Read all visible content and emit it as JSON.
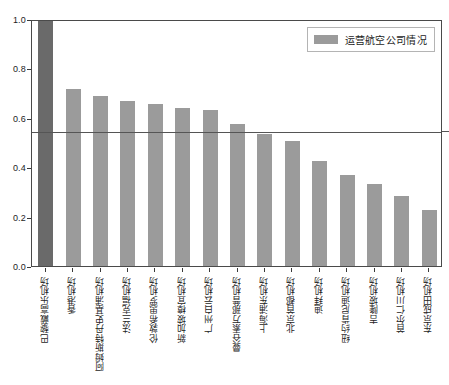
{
  "chart_data": {
    "type": "bar",
    "title": "",
    "xlabel": "",
    "ylabel": "",
    "ylim": [
      0.0,
      1.0
    ],
    "grid": false,
    "legend_position": "top-right",
    "categories": [
      "巴黎戴高乐机场",
      "香港机场",
      "阿姆斯特丹史基浦机场",
      "法兰克福机场",
      "伦敦希思罗机场",
      "新加坡樟宜机场",
      "广州白云机场",
      "曼谷素万那普机场",
      "上海浦东机场",
      "北京首都机场",
      "迪拜机场",
      "纽约肯尼迪机场",
      "吉隆坡机场",
      "首尔仁川机场",
      "东京成田机场"
    ],
    "values": [
      1.0,
      0.715,
      0.688,
      0.668,
      0.655,
      0.638,
      0.63,
      0.575,
      0.533,
      0.505,
      0.425,
      0.368,
      0.333,
      0.285,
      0.225
    ],
    "series": [
      {
        "name": "运营航空公司情况",
        "values": [
          1.0,
          0.715,
          0.688,
          0.668,
          0.655,
          0.638,
          0.63,
          0.575,
          0.533,
          0.505,
          0.425,
          0.368,
          0.333,
          0.285,
          0.225
        ]
      }
    ],
    "ytick_labels": [
      "0.0",
      "0.2",
      "0.4",
      "0.6",
      "0.8",
      "1.0"
    ],
    "ytick_values": [
      0.0,
      0.2,
      0.4,
      0.6,
      0.8,
      1.0
    ],
    "annotations": [
      {
        "type": "hline",
        "value": 0.55,
        "label": ""
      }
    ],
    "colors": {
      "bar": "#9b9b9b",
      "bar_highlight": "#6a6a6a",
      "axis": "#4a4a4a",
      "threshold_line": "#555555",
      "text": "#1d1d1d",
      "background": "#ffffff"
    }
  },
  "legend": {
    "label": "运营航空公司情况"
  }
}
